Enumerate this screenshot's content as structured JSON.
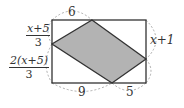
{
  "diagram": {
    "type": "geometry-figure",
    "colors": {
      "outline": "#333333",
      "shade": "#b3b3b3",
      "dashed_arc": "#999999",
      "background": "#ffffff"
    },
    "rectangle": {
      "x1": 52,
      "y1": 20,
      "x2": 146,
      "y2": 83
    },
    "parallelogram": [
      [
        92,
        20
      ],
      [
        146,
        59
      ],
      [
        112,
        83
      ],
      [
        52,
        44
      ]
    ],
    "labels": {
      "top_left_segment": "6",
      "bottom_left_segment": "9",
      "bottom_right_segment": "5",
      "right_upper_segment": "x+1",
      "left_upper_segment": {
        "numerator": "x+5",
        "denominator": "3"
      },
      "left_lower_segment": {
        "numerator": "2(x+5)",
        "denominator": "3"
      }
    }
  }
}
